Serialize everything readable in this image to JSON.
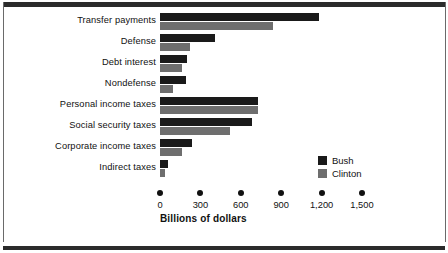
{
  "chart_data": {
    "type": "bar",
    "orientation": "horizontal",
    "title": "",
    "xlabel": "Billions of dollars",
    "ylabel": "",
    "xlim": [
      0,
      1500
    ],
    "xticks": [
      "0",
      "300",
      "600",
      "900",
      "1,200",
      "1,500"
    ],
    "xtick_values": [
      0,
      300,
      600,
      900,
      1200,
      1500
    ],
    "grid": false,
    "legend_position": "right-inside",
    "categories": [
      "Transfer payments",
      "Defense",
      "Debt interest",
      "Nondefense",
      "Personal income taxes",
      "Social security taxes",
      "Corporate income taxes",
      "Indirect taxes"
    ],
    "series": [
      {
        "name": "Bush",
        "color": "#1a1a1a",
        "values": [
          1180,
          410,
          200,
          195,
          730,
          680,
          235,
          60
        ]
      },
      {
        "name": "Clinton",
        "color": "#6e6e6e",
        "values": [
          840,
          225,
          165,
          100,
          730,
          520,
          165,
          40
        ]
      }
    ]
  },
  "legend": {
    "items": [
      {
        "label": "Bush",
        "color": "#1a1a1a"
      },
      {
        "label": "Clinton",
        "color": "#6e6e6e"
      }
    ]
  },
  "axis": {
    "title": "Billions of dollars"
  }
}
